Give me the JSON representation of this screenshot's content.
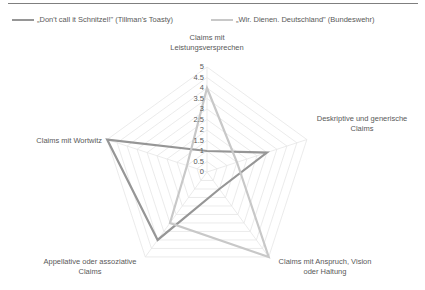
{
  "chart_data": {
    "type": "radar",
    "title": "",
    "axes": [
      "Claims mit Leistungsversprechen",
      "Deskriptive und generische Claims",
      "Claims mit Anspruch, Vision oder Haltung",
      "Appellative oder assoziative Claims",
      "Claims mit Wortwitz"
    ],
    "series": [
      {
        "name": "„Don't call it Schnitzel!\" (Tillman's Toasty)",
        "color": "#969696",
        "values": [
          1,
          3,
          1,
          4,
          5
        ]
      },
      {
        "name": "„Wir. Dienen. Deutschland\" (Bundeswehr)",
        "color": "#c8c8c8",
        "values": [
          4,
          1.5,
          5,
          3,
          1
        ]
      }
    ],
    "ticks": [
      "0",
      "0.5",
      "1",
      "1.5",
      "2",
      "2.5",
      "3",
      "3.5",
      "4",
      "4.5",
      "5"
    ],
    "rlim": [
      0,
      5
    ],
    "grid": true,
    "legend_position": "top"
  },
  "legend": {
    "series1": "„Don't call it Schnitzel!\" (Tillman's Toasty)",
    "series2": "„Wir. Dienen. Deutschland\" (Bundeswehr)"
  },
  "labels": {
    "axis0_line1": "Claims mit",
    "axis0_line2": "Leistungsversprechen",
    "axis1_line1": "Deskriptive und generische",
    "axis1_line2": "Claims",
    "axis2_line1": "Claims mit Anspruch, Vision",
    "axis2_line2": "oder Haltung",
    "axis3_line1": "Appellative oder assoziative",
    "axis3_line2": "Claims",
    "axis4_line1": "Claims mit Wortwitz"
  }
}
